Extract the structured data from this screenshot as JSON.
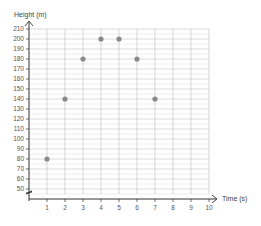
{
  "chart_data": {
    "type": "scatter",
    "title": "",
    "xlabel": "Time (s)",
    "ylabel": "Height (m)",
    "x": [
      1,
      2,
      3,
      4,
      5,
      6,
      7
    ],
    "values": [
      80,
      140,
      180,
      200,
      200,
      180,
      140
    ],
    "series": [
      {
        "name": "Height",
        "x": [
          1,
          2,
          3,
          4,
          5,
          6,
          7
        ],
        "values": [
          80,
          140,
          180,
          200,
          200,
          180,
          140
        ]
      }
    ],
    "xlim": [
      0,
      10
    ],
    "ylim": [
      50,
      210
    ],
    "x_ticks": [
      "1",
      "2",
      "3",
      "4",
      "5",
      "6",
      "7",
      "8",
      "9",
      "10"
    ],
    "y_ticks": [
      "50",
      "60",
      "70",
      "80",
      "90",
      "100",
      "110",
      "120",
      "130",
      "140",
      "150",
      "160",
      "170",
      "180",
      "190",
      "200",
      "210"
    ],
    "y_axis_break": true,
    "grid": true,
    "legend": "none",
    "colors": {
      "marker": "#8a8a8a",
      "grid": "#bdbdbd",
      "axis": "#333333"
    }
  }
}
